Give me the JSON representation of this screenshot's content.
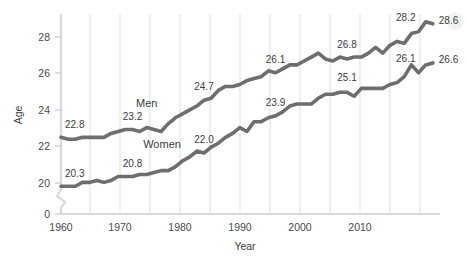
{
  "chart_data": {
    "type": "line",
    "title": "",
    "xlabel": "Year",
    "ylabel": "Age",
    "xlim": [
      1960,
      2013
    ],
    "ylim": [
      19.6,
      29.1
    ],
    "y_axis_broken": true,
    "y_break_base_label": "0",
    "grid": "vertical gridlines every 5 years",
    "legend": "inline series labels on plot",
    "xticks": [
      1960,
      1970,
      1980,
      1990,
      2000,
      2010
    ],
    "xtick_labels": [
      "1960",
      "1970",
      "1980",
      "1990",
      "2000",
      "2010"
    ],
    "gridline_years": [
      1965,
      1970,
      1975,
      1980,
      1985,
      1990,
      1995,
      2000,
      2005,
      2010
    ],
    "yticks": [
      20,
      22,
      24,
      26,
      28
    ],
    "ytick_labels": [
      "20",
      "22",
      "24",
      "26",
      "28"
    ],
    "series": [
      {
        "name": "Men",
        "label_x": 1970.5,
        "label_y": 24.35,
        "x": [
          1960,
          1961,
          1962,
          1963,
          1964,
          1965,
          1966,
          1967,
          1968,
          1969,
          1970,
          1971,
          1972,
          1973,
          1974,
          1975,
          1976,
          1977,
          1978,
          1979,
          1980,
          1981,
          1982,
          1983,
          1984,
          1985,
          1986,
          1987,
          1988,
          1989,
          1990,
          1991,
          1992,
          1993,
          1994,
          1995,
          1996,
          1997,
          1998,
          1999,
          2000,
          2001,
          2002,
          2003,
          2004,
          2005,
          2006,
          2007,
          2008,
          2009,
          2010,
          2011,
          2012
        ],
        "values": [
          22.8,
          22.7,
          22.7,
          22.8,
          22.8,
          22.8,
          22.8,
          23.0,
          23.1,
          23.2,
          23.2,
          23.1,
          23.3,
          23.2,
          23.1,
          23.5,
          23.8,
          24.0,
          24.2,
          24.4,
          24.7,
          24.8,
          25.2,
          25.4,
          25.4,
          25.5,
          25.7,
          25.8,
          25.9,
          26.2,
          26.1,
          26.3,
          26.5,
          26.5,
          26.7,
          26.9,
          27.1,
          26.8,
          26.7,
          26.9,
          26.8,
          26.9,
          26.9,
          27.1,
          27.4,
          27.1,
          27.5,
          27.7,
          27.6,
          28.1,
          28.2,
          28.7,
          28.6
        ]
      },
      {
        "name": "Women",
        "label_x": 1971.5,
        "label_y": 22.25,
        "x": [
          1960,
          1961,
          1962,
          1963,
          1964,
          1965,
          1966,
          1967,
          1968,
          1969,
          1970,
          1971,
          1972,
          1973,
          1974,
          1975,
          1976,
          1977,
          1978,
          1979,
          1980,
          1981,
          1982,
          1983,
          1984,
          1985,
          1986,
          1987,
          1988,
          1989,
          1990,
          1991,
          1992,
          1993,
          1994,
          1995,
          1996,
          1997,
          1998,
          1999,
          2000,
          2001,
          2002,
          2003,
          2004,
          2005,
          2006,
          2007,
          2008,
          2009,
          2010,
          2011,
          2012
        ],
        "values": [
          20.3,
          20.3,
          20.3,
          20.5,
          20.5,
          20.6,
          20.5,
          20.6,
          20.8,
          20.8,
          20.8,
          20.9,
          20.9,
          21.0,
          21.1,
          21.1,
          21.3,
          21.6,
          21.8,
          22.1,
          22.0,
          22.3,
          22.5,
          22.8,
          23.0,
          23.3,
          23.1,
          23.6,
          23.6,
          23.8,
          23.9,
          24.1,
          24.4,
          24.5,
          24.5,
          24.5,
          24.8,
          25.0,
          25.0,
          25.1,
          25.1,
          24.9,
          25.3,
          25.3,
          25.3,
          25.3,
          25.5,
          25.6,
          25.9,
          26.5,
          26.1,
          26.5,
          26.6
        ]
      }
    ],
    "point_labels": [
      {
        "series": "Men",
        "year": 1960,
        "value": 22.8,
        "text": "22.8"
      },
      {
        "series": "Men",
        "year": 1970,
        "value": 23.2,
        "text": "23.2"
      },
      {
        "series": "Men",
        "year": 1980,
        "value": 24.7,
        "text": "24.7"
      },
      {
        "series": "Men",
        "year": 1990,
        "value": 26.1,
        "text": "26.1"
      },
      {
        "series": "Men",
        "year": 2000,
        "value": 26.8,
        "text": "26.8"
      },
      {
        "series": "Men",
        "year": 2010,
        "value": 28.2,
        "text": "28.2"
      },
      {
        "series": "Men",
        "year": 2012,
        "value": 28.6,
        "text": "28.6"
      },
      {
        "series": "Women",
        "year": 1960,
        "value": 20.3,
        "text": "20.3"
      },
      {
        "series": "Women",
        "year": 1970,
        "value": 20.8,
        "text": "20.8"
      },
      {
        "series": "Women",
        "year": 1980,
        "value": 22.0,
        "text": "22.0"
      },
      {
        "series": "Women",
        "year": 1990,
        "value": 23.9,
        "text": "23.9"
      },
      {
        "series": "Women",
        "year": 2000,
        "value": 25.1,
        "text": "25.1"
      },
      {
        "series": "Women",
        "year": 2010,
        "value": 26.1,
        "text": "26.1"
      },
      {
        "series": "Women",
        "year": 2012,
        "value": 26.6,
        "text": "26.6"
      }
    ],
    "colors": {
      "line": "#6e6e6e",
      "grid": "#e2e2e2",
      "axis": "#d8d8d8",
      "text": "#3c3c3c",
      "background": "#ffffff"
    }
  },
  "labels": {
    "y_axis_title": "Age",
    "x_axis_title": "Year",
    "y_zero": "0",
    "men": "Men",
    "women": "Women"
  },
  "ticks": {
    "y": [
      "28",
      "26",
      "24",
      "22",
      "20"
    ],
    "x": [
      "1960",
      "1970",
      "1980",
      "1990",
      "2000",
      "2010"
    ]
  },
  "point_label_text": {
    "men_1960": "22.8",
    "men_1970": "23.2",
    "men_1980": "24.7",
    "men_1990": "26.1",
    "men_2000": "26.8",
    "men_2010": "28.2",
    "men_2012": "28.6",
    "women_1960": "20.3",
    "women_1970": "20.8",
    "women_1980": "22.0",
    "women_1990": "23.9",
    "women_2000": "25.1",
    "women_2010": "26.1",
    "women_2012": "26.6"
  }
}
